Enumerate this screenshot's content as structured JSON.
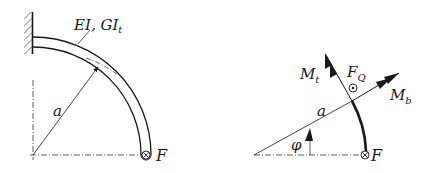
{
  "left_figure": {
    "stiffness_label_main": "EI, GI",
    "stiffness_label_sub": "t",
    "radius_label": "a",
    "force_label": "F",
    "force_symbol": "into-page-cross-icon"
  },
  "right_figure": {
    "torsion_moment_label_main": "M",
    "torsion_moment_label_sub": "t",
    "shear_force_label_main": "F",
    "shear_force_label_sub": "Q",
    "bending_moment_label_main": "M",
    "bending_moment_label_sub": "b",
    "radius_label": "a",
    "angle_label": "φ",
    "force_label": "F",
    "shear_symbol": "out-of-page-dot-icon",
    "force_symbol": "into-page-cross-icon"
  },
  "colors": {
    "ink": "#1a1a1a",
    "background": "#ffffff"
  }
}
